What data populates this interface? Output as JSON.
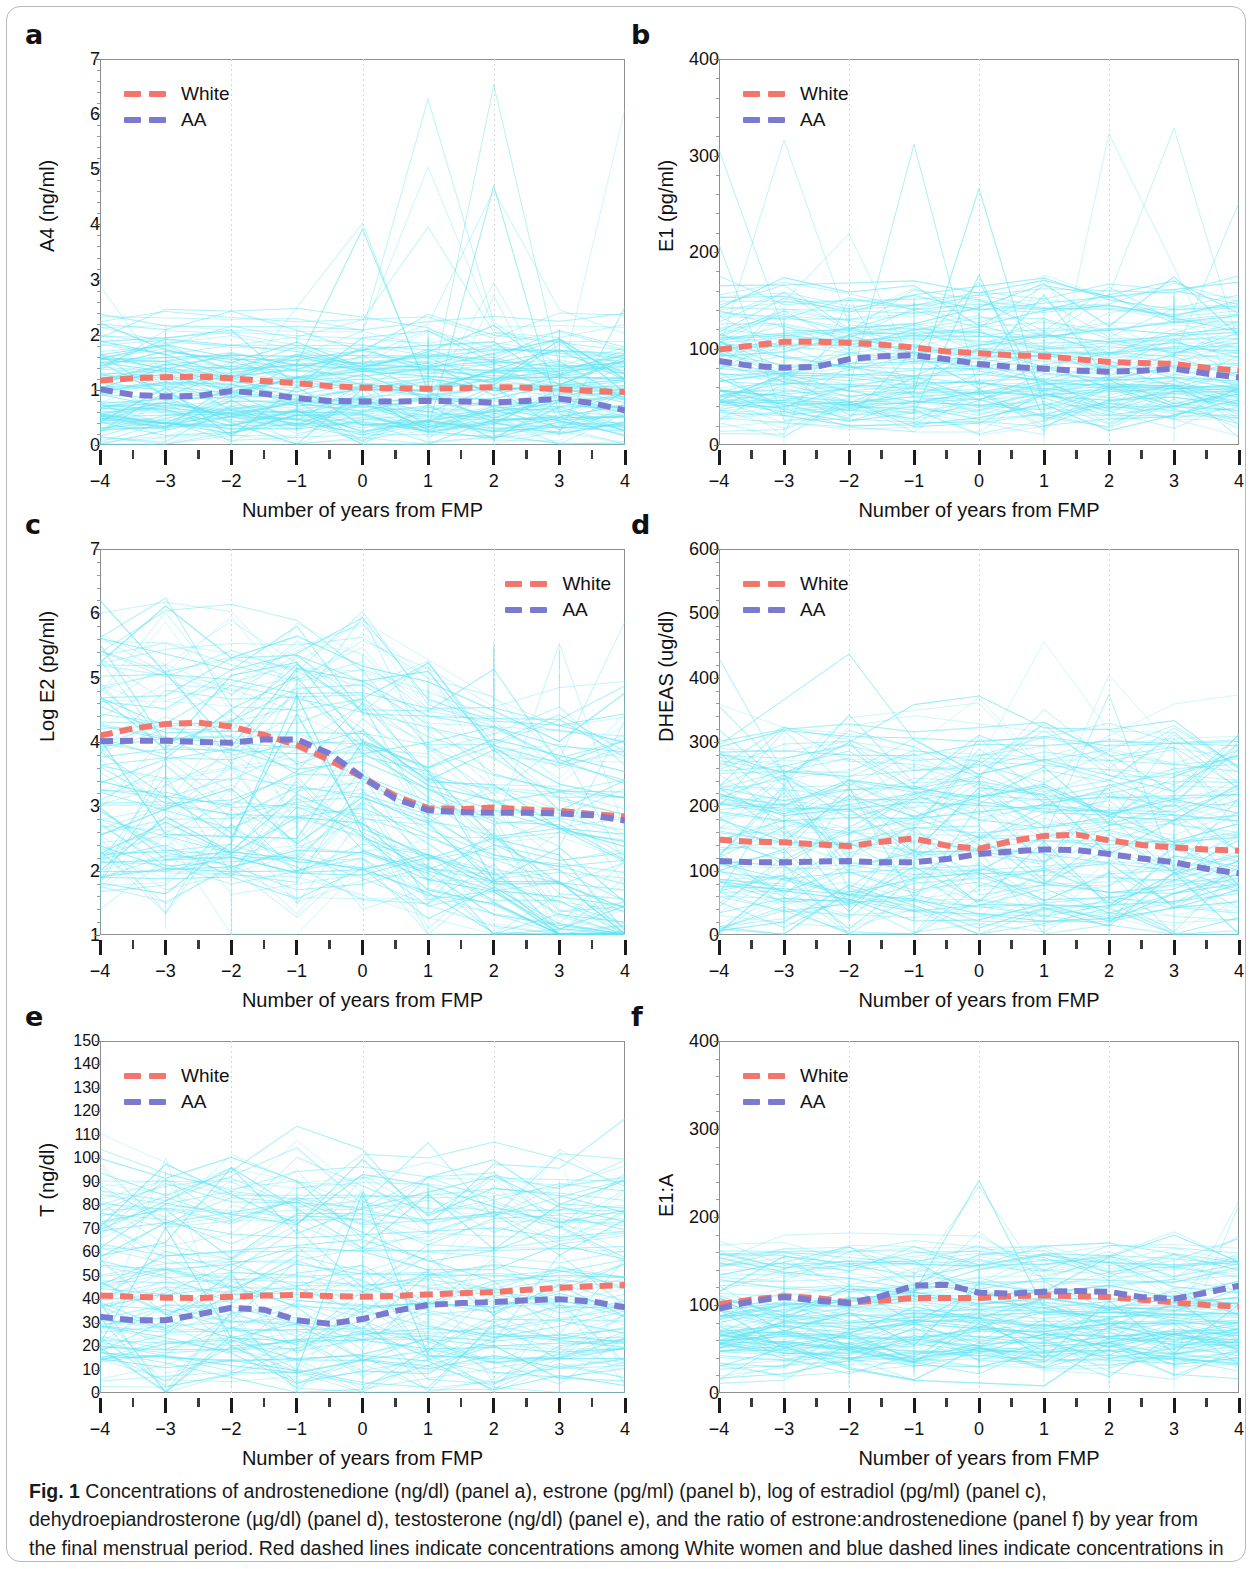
{
  "figure": {
    "caption_label": "Fig. 1",
    "caption_text": " Concentrations of androstenedione (ng/dl) (panel a), estrone (pg/ml) (panel b), log of estradiol (pg/ml) (panel c), dehydroepiandrosterone (µg/dl) (panel d), testosterone (ng/dl) (panel e), and the ratio of estrone:androstenedione (panel f) by year from the final menstrual period. Red dashed lines indicate concentrations among White women and blue dashed lines indicate concentrations in African-Americans (AAs)"
  },
  "colors": {
    "white_line": "#F4756B",
    "aa_line": "#7A7BD0",
    "spaghetti": "#63E4F2",
    "axis": "#8f8f8f",
    "text": "#111111"
  },
  "legend": {
    "white_label": "White",
    "aa_label": "AA"
  },
  "shared": {
    "xlabel": "Number of years from FMP",
    "x_ticks": [
      "−4",
      "−3",
      "−2",
      "−1",
      "0",
      "1",
      "2",
      "3",
      "4"
    ],
    "x_values": [
      -4,
      -3,
      -2,
      -1,
      0,
      1,
      2,
      3,
      4
    ]
  },
  "chart_data": [
    {
      "panel": "a",
      "letter": "a",
      "type": "line",
      "title": "",
      "xlabel": "Number of years from FMP",
      "ylabel": "A4 (ng/ml)",
      "xlim": [
        -4,
        4
      ],
      "ylim": [
        0,
        7
      ],
      "y_ticks": [
        0,
        1,
        2,
        3,
        4,
        5,
        6,
        7
      ],
      "y_tick_labels": [
        "0",
        "1",
        "2",
        "3",
        "4",
        "5",
        "6",
        "7"
      ],
      "legend_position": "top-left",
      "grid": "vertical-dotted at -2, 0, 2",
      "x": [
        -4,
        -3.5,
        -3,
        -2.5,
        -2,
        -1.5,
        -1,
        -0.5,
        0,
        0.5,
        1,
        1.5,
        2,
        2.5,
        3,
        3.5,
        4
      ],
      "series": [
        {
          "name": "White",
          "values": [
            1.17,
            1.21,
            1.23,
            1.24,
            1.21,
            1.16,
            1.12,
            1.07,
            1.04,
            1.03,
            1.02,
            1.03,
            1.05,
            1.04,
            1.01,
            0.98,
            0.96
          ]
        },
        {
          "name": "AA",
          "values": [
            1.01,
            0.91,
            0.88,
            0.89,
            0.98,
            0.93,
            0.85,
            0.8,
            0.79,
            0.79,
            0.8,
            0.79,
            0.77,
            0.8,
            0.84,
            0.76,
            0.63
          ]
        }
      ],
      "spaghetti_band": [
        0.25,
        2.2
      ],
      "spaghetti_outlier_max": 6.7
    },
    {
      "panel": "b",
      "letter": "b",
      "type": "line",
      "title": "",
      "xlabel": "Number of years from FMP",
      "ylabel": "E1 (pg/ml)",
      "xlim": [
        -4,
        4
      ],
      "ylim": [
        0,
        400
      ],
      "y_ticks": [
        0,
        100,
        200,
        300,
        400
      ],
      "y_tick_labels": [
        "0",
        "100",
        "200",
        "300",
        "400"
      ],
      "legend_position": "top-left",
      "grid": "vertical-dotted at -2, 0, 2",
      "x": [
        -4,
        -3.5,
        -3,
        -2.5,
        -2,
        -1.5,
        -1,
        -0.5,
        0,
        0.5,
        1,
        1.5,
        2,
        2.5,
        3,
        3.5,
        4
      ],
      "series": [
        {
          "name": "White",
          "values": [
            99,
            103,
            107,
            107,
            106,
            104,
            101,
            97,
            95,
            93,
            92,
            89,
            86,
            85,
            84,
            80,
            77
          ]
        },
        {
          "name": "AA",
          "values": [
            87,
            82,
            80,
            81,
            89,
            92,
            93,
            89,
            84,
            81,
            79,
            77,
            76,
            77,
            79,
            74,
            70
          ]
        }
      ],
      "spaghetti_band": [
        35,
        160
      ],
      "spaghetti_outlier_max": 340
    },
    {
      "panel": "c",
      "letter": "c",
      "type": "line",
      "title": "",
      "xlabel": "Number of years from FMP",
      "ylabel": "Log E2 (pg/ml)",
      "xlim": [
        -4,
        4
      ],
      "ylim": [
        1,
        7
      ],
      "y_ticks": [
        1,
        2,
        3,
        4,
        5,
        6,
        7
      ],
      "y_tick_labels": [
        "1",
        "2",
        "3",
        "4",
        "5",
        "6",
        "7"
      ],
      "legend_position": "top-right",
      "grid": "vertical-dotted at -2, 0, 2",
      "x": [
        -4,
        -3.5,
        -3,
        -2.5,
        -2,
        -1.5,
        -1,
        -0.5,
        0,
        0.5,
        1,
        1.5,
        2,
        2.5,
        3,
        3.5,
        4
      ],
      "series": [
        {
          "name": "White",
          "values": [
            4.1,
            4.21,
            4.28,
            4.3,
            4.24,
            4.11,
            3.95,
            3.72,
            3.45,
            3.16,
            2.97,
            2.96,
            2.98,
            2.95,
            2.93,
            2.88,
            2.84
          ]
        },
        {
          "name": "AA",
          "values": [
            4.01,
            4.02,
            4.02,
            4.0,
            3.99,
            4.04,
            4.04,
            3.82,
            3.45,
            3.12,
            2.94,
            2.91,
            2.9,
            2.9,
            2.89,
            2.86,
            2.78
          ]
        }
      ],
      "spaghetti_band": [
        1.9,
        5.6
      ],
      "spaghetti_outlier_max": 6.4
    },
    {
      "panel": "d",
      "letter": "d",
      "type": "line",
      "title": "",
      "xlabel": "Number of years from FMP",
      "ylabel": "DHEAS (ug/dl)",
      "xlim": [
        -4,
        4
      ],
      "ylim": [
        0,
        600
      ],
      "y_ticks": [
        0,
        100,
        200,
        300,
        400,
        500,
        600
      ],
      "y_tick_labels": [
        "0",
        "100",
        "200",
        "300",
        "400",
        "500",
        "600"
      ],
      "legend_position": "top-left",
      "grid": "vertical-dotted at -2, 0, 2",
      "x": [
        -4,
        -3.5,
        -3,
        -2.5,
        -2,
        -1.5,
        -1,
        -0.5,
        0,
        0.5,
        1,
        1.5,
        2,
        2.5,
        3,
        3.5,
        4
      ],
      "series": [
        {
          "name": "White",
          "values": [
            148,
            145,
            144,
            141,
            138,
            145,
            150,
            139,
            134,
            146,
            154,
            156,
            147,
            140,
            136,
            133,
            131
          ]
        },
        {
          "name": "AA",
          "values": [
            115,
            113,
            113,
            114,
            115,
            113,
            113,
            118,
            126,
            130,
            133,
            132,
            126,
            119,
            113,
            103,
            96
          ]
        }
      ],
      "spaghetti_band": [
        25,
        320
      ],
      "spaghetti_outlier_max": 470
    },
    {
      "panel": "e",
      "letter": "e",
      "type": "line",
      "title": "",
      "xlabel": "Number of years from FMP",
      "ylabel": "T (ng/dl)",
      "xlim": [
        -4,
        4
      ],
      "ylim": [
        0,
        150
      ],
      "y_ticks": [
        0,
        10,
        20,
        30,
        40,
        50,
        60,
        70,
        80,
        90,
        100,
        110,
        120,
        130,
        140,
        150
      ],
      "y_tick_labels": [
        "0",
        "10",
        "20",
        "30",
        "40",
        "50",
        "60",
        "70",
        "80",
        "90",
        "100",
        "110",
        "120",
        "130",
        "140",
        "150"
      ],
      "legend_position": "top-left",
      "grid": "vertical-dotted at -2, 0, 2",
      "x": [
        -4,
        -3.5,
        -3,
        -2.5,
        -2,
        -1.5,
        -1,
        -0.5,
        0,
        0.5,
        1,
        1.5,
        2,
        2.5,
        3,
        3.5,
        4
      ],
      "series": [
        {
          "name": "White",
          "values": [
            41.5,
            41.0,
            40.6,
            40.5,
            41.0,
            41.5,
            41.8,
            41.3,
            41.0,
            41.4,
            42.0,
            42.5,
            43.0,
            44.0,
            44.8,
            45.5,
            46.0
          ]
        },
        {
          "name": "AA",
          "values": [
            32.5,
            31.0,
            31.0,
            33.5,
            36.3,
            35.5,
            31.0,
            29.5,
            31.5,
            35.0,
            37.5,
            38.3,
            38.8,
            39.5,
            40.0,
            39.0,
            36.5
          ]
        }
      ],
      "spaghetti_band": [
        9,
        95
      ],
      "spaghetti_outlier_max": 105
    },
    {
      "panel": "f",
      "letter": "f",
      "type": "line",
      "title": "",
      "xlabel": "Number of years from FMP",
      "ylabel": "E1:A",
      "xlim": [
        -4,
        4
      ],
      "ylim": [
        0,
        400
      ],
      "y_ticks": [
        0,
        100,
        200,
        300,
        400
      ],
      "y_tick_labels": [
        "0",
        "100",
        "200",
        "300",
        "400"
      ],
      "legend_position": "top-left",
      "grid": "vertical-dotted at -2, 0, 2",
      "x": [
        -4,
        -3.5,
        -3,
        -2.5,
        -2,
        -1.5,
        -1,
        -0.5,
        0,
        0.5,
        1,
        1.5,
        2,
        2.5,
        3,
        3.5,
        4
      ],
      "series": [
        {
          "name": "White",
          "values": [
            101,
            106,
            110,
            108,
            103,
            105,
            108,
            108,
            108,
            110,
            111,
            110,
            109,
            106,
            103,
            100,
            98
          ]
        },
        {
          "name": "AA",
          "values": [
            96,
            104,
            109,
            105,
            102,
            110,
            122,
            123,
            114,
            113,
            115,
            116,
            115,
            109,
            107,
            114,
            122
          ]
        }
      ],
      "spaghetti_band": [
        35,
        160
      ],
      "spaghetti_outlier_max": 245
    }
  ]
}
